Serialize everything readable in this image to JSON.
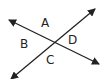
{
  "diagram": {
    "type": "intersecting-lines",
    "stroke_color": "#222222",
    "lines": [
      {
        "name": "line-1",
        "from": [
          9,
          20
        ],
        "to": [
          99,
          64
        ]
      },
      {
        "name": "line-2",
        "from": [
          11,
          79
        ],
        "to": [
          95,
          9
        ]
      }
    ],
    "labels": [
      {
        "id": "A",
        "text": "A",
        "x": 41,
        "y": 17
      },
      {
        "id": "B",
        "text": "B",
        "x": 20,
        "y": 38
      },
      {
        "id": "C",
        "text": "C",
        "x": 46,
        "y": 54
      },
      {
        "id": "D",
        "text": "D",
        "x": 68,
        "y": 34
      }
    ]
  }
}
